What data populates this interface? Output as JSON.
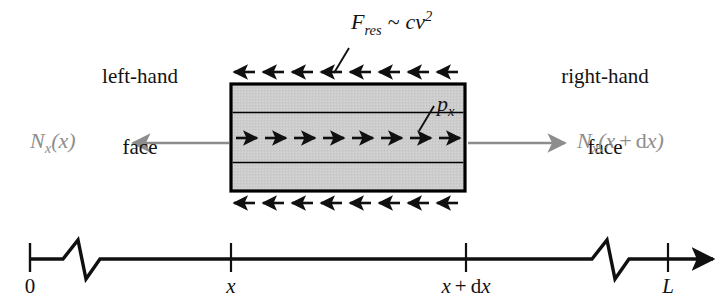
{
  "figure": {
    "colors": {
      "ink": "#121212",
      "gray_label": "#8d8d8d",
      "box_fill": "#cccccc",
      "box_stroke": "#000000",
      "background": "#ffffff"
    },
    "labels": {
      "left_face_line1": "left-hand",
      "left_face_line2": "face",
      "right_face_line1": "right-hand",
      "right_face_line2": "face",
      "resistive_force": {
        "symbol": "F",
        "subscript": "res",
        "relation": "~",
        "coefficient": "c",
        "velocity": "v",
        "exponent": "2",
        "full": "F_res ~ cv^2"
      },
      "momentum_density": {
        "symbol": "p",
        "subscript": "x",
        "full": "p_x"
      },
      "flux_left": {
        "symbol": "N",
        "subscript": "x",
        "argument": "(x)",
        "full": "N_x(x)"
      },
      "flux_right": {
        "symbol": "N",
        "subscript": "x",
        "arg_open": "(",
        "arg_var": "x",
        "arg_plus": "+",
        "arg_d": "d",
        "arg_dvar": "x",
        "arg_close": ")",
        "full": "N_x(x + dx)"
      }
    },
    "axis": {
      "ticks": [
        {
          "name": "origin",
          "label": "0",
          "x": 30
        },
        {
          "name": "x",
          "label": "x",
          "x": 231
        },
        {
          "name": "x-plus-dx",
          "label_var": "x",
          "label_op": "+",
          "label_d": "d",
          "label_dvar": "x",
          "label": "x + dx",
          "x": 466
        },
        {
          "name": "length",
          "label": "L",
          "x": 668
        }
      ],
      "breaks": 2,
      "arrow_end": "right"
    },
    "arrow_rows": {
      "top_count": 8,
      "bottom_count": 8,
      "inner_count": 8,
      "top_direction": "left",
      "bottom_direction": "left",
      "inner_direction": "right"
    }
  }
}
